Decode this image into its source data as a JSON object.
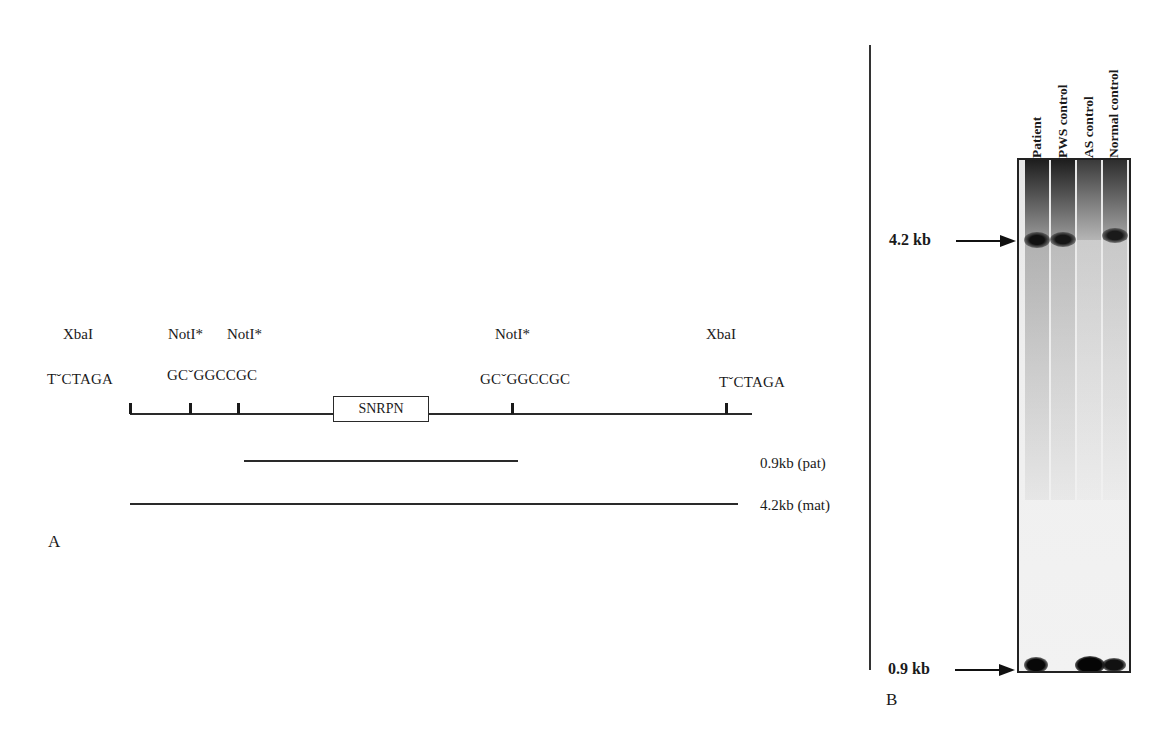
{
  "panel_a": {
    "letter": "A",
    "sites": [
      {
        "enzyme": "XbaI",
        "sequence": "TˇCTAGA",
        "x": 131
      },
      {
        "enzyme": "NotI*",
        "sequence": "GCˇGGCCGC",
        "x": 190
      },
      {
        "enzyme": "NotI*",
        "sequence": "",
        "x": 238
      },
      {
        "enzyme": "NotI*",
        "sequence": "GCˇGGCCGC",
        "x": 513
      },
      {
        "enzyme": "XbaI",
        "sequence": "TˇCTAGA",
        "x": 727
      }
    ],
    "labels": {
      "xbai_left": "XbaI",
      "noti_1": "NotI*",
      "noti_2": "NotI*",
      "noti_3": "NotI*",
      "xbai_right": "XbaI",
      "seq_xbai_left": "TˇCTAGA",
      "seq_noti_left": "GCˇGGCCGC",
      "seq_noti_right": "GCˇGGCCGC",
      "seq_xbai_right": "TˇCTAGA"
    },
    "gene": "SNRPN",
    "fragments": [
      {
        "label": "0.9kb (pat)",
        "from": "NotI*",
        "to": "NotI*"
      },
      {
        "label": "4.2kb (mat)",
        "from": "XbaI",
        "to": "XbaI"
      }
    ]
  },
  "panel_b": {
    "letter": "B",
    "size_markers": [
      {
        "label": "4.2 kb"
      },
      {
        "label": "0.9 kb"
      }
    ],
    "lanes": [
      {
        "label": "Patient",
        "band_4_2kb": "strong",
        "band_0_9kb": "strong"
      },
      {
        "label": "PWS control",
        "band_4_2kb": "strong",
        "band_0_9kb": "absent"
      },
      {
        "label": "AS control",
        "band_4_2kb": "absent",
        "band_0_9kb": "very strong"
      },
      {
        "label": "Normal control",
        "band_4_2kb": "strong",
        "band_0_9kb": "strong"
      }
    ]
  }
}
